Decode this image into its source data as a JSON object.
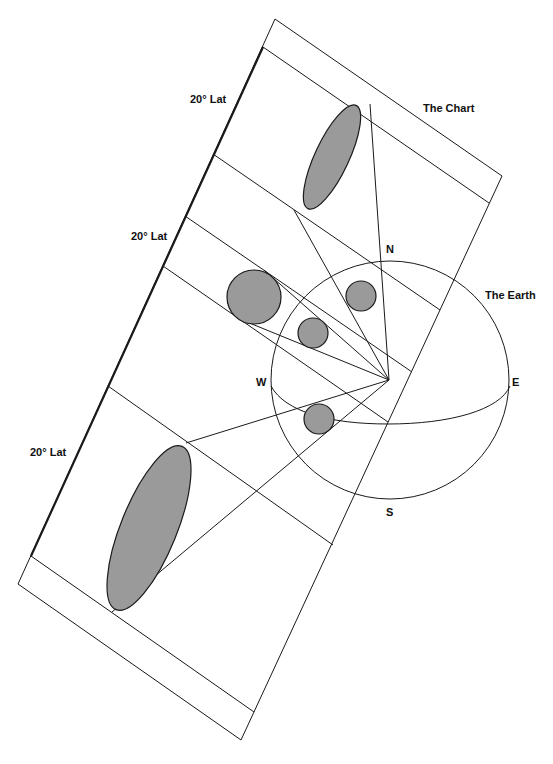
{
  "labels": {
    "lat_top": "20° Lat",
    "lat_middle": "20° Lat",
    "lat_bottom": "20° Lat",
    "chart": "The Chart",
    "earth": "The Earth",
    "north": "N",
    "south": "S",
    "west": "W",
    "east": "E"
  },
  "colors": {
    "line": "#1a1a1a",
    "fill": "#9a9a9a",
    "background": "#ffffff"
  }
}
